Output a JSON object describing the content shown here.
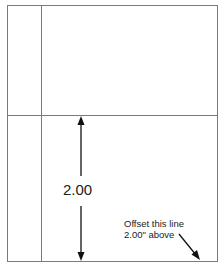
{
  "diagram": {
    "dimension_label": "2.00",
    "note_line1": "Offset this line",
    "note_line2": "2.00\" above",
    "colors": {
      "line": "#7a7a7a",
      "arrow": "#111111",
      "text": "#222222"
    }
  }
}
